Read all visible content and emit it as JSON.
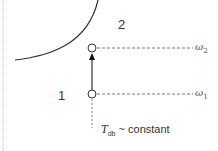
{
  "diagram": {
    "type": "psychrometric-process",
    "regions": [
      {
        "id": "region-1",
        "label": "1"
      },
      {
        "id": "region-2",
        "label": "2"
      }
    ],
    "states": [
      {
        "id": "state-1",
        "humidity_label_symbol": "ω",
        "humidity_label_sub": "1"
      },
      {
        "id": "state-2",
        "humidity_label_symbol": "ω",
        "humidity_label_sub": "2"
      }
    ],
    "process_annotation": {
      "symbol": "T",
      "subscript": "db",
      "text": " ~ constant"
    },
    "colors": {
      "line": "#333333",
      "dashed": "#555555",
      "border": "#bbbbbb",
      "background": "#ffffff"
    }
  }
}
